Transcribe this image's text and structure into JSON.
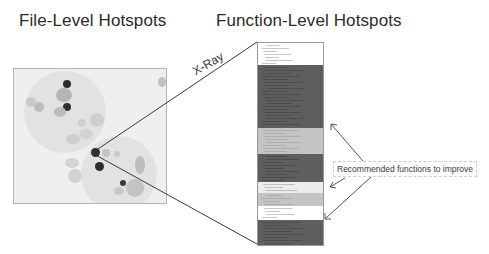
{
  "titles": {
    "file_level": "File-Level Hotspots",
    "function_level": "Function-Level Hotspots"
  },
  "connector": {
    "label": "X-Ray"
  },
  "callout": {
    "label": "Recommended functions to improve",
    "arrow_count": 3
  },
  "colors": {
    "background": "#ffffff",
    "hotspot_dark": "#2e2e2e",
    "hotspot_light": "#b8b8b8",
    "cluster": "#e2e2e2",
    "band_dark": "#5e5e5e",
    "band_mid": "#c4c4c4",
    "band_light": "#ececec",
    "band_white": "#ffffff"
  },
  "function_bands": [
    {
      "shade": "white",
      "top": 0,
      "height": 22,
      "recommended": false
    },
    {
      "shade": "dark",
      "top": 22,
      "height": 63,
      "recommended": true
    },
    {
      "shade": "mid",
      "top": 85,
      "height": 26,
      "recommended": false
    },
    {
      "shade": "dark",
      "top": 111,
      "height": 28,
      "recommended": true
    },
    {
      "shade": "light",
      "top": 139,
      "height": 11,
      "recommended": false
    },
    {
      "shade": "mid",
      "top": 150,
      "height": 13,
      "recommended": false
    },
    {
      "shade": "white",
      "top": 163,
      "height": 14,
      "recommended": false
    },
    {
      "shade": "dark",
      "top": 177,
      "height": 25,
      "recommended": true
    }
  ]
}
